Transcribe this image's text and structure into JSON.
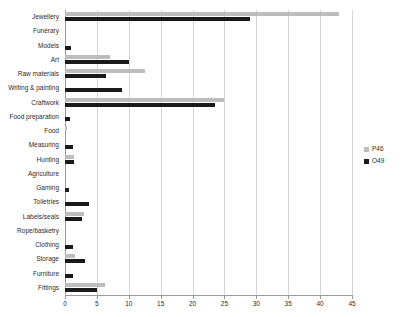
{
  "chart_data": {
    "type": "bar",
    "orientation": "horizontal",
    "title": "",
    "xlabel": "",
    "ylabel": "",
    "xlim": [
      0,
      45
    ],
    "xticks": [
      0,
      5,
      10,
      15,
      20,
      25,
      30,
      35,
      40,
      45
    ],
    "grid": true,
    "legend_position": "right",
    "categories": [
      "Jewellery",
      "Funerary",
      "Models",
      "Art",
      "Raw materials",
      "Writing & painting",
      "Craftwork",
      "Food preparation",
      "Food",
      "Measuring",
      "Hunting",
      "Agriculture",
      "Gaming",
      "Toiletries",
      "Labels/seals",
      "Rope/basketry",
      "Clothing",
      "Storage",
      "Furniture",
      "Fittings"
    ],
    "series": [
      {
        "name": "P46",
        "color": "#bdbdbd",
        "values": [
          43.0,
          0,
          0,
          7.0,
          12.5,
          0,
          25.0,
          0,
          0.3,
          0,
          1.4,
          0,
          0,
          0,
          3.0,
          0,
          0,
          1.5,
          0,
          6.2
        ]
      },
      {
        "name": "O49",
        "color": "#1a1a1a",
        "values": [
          29.0,
          0,
          1.0,
          10.0,
          6.5,
          9.0,
          23.5,
          0.8,
          0,
          1.3,
          1.4,
          0,
          0.6,
          3.7,
          2.7,
          0,
          1.3,
          3.2,
          1.2,
          5.0
        ]
      }
    ]
  },
  "legend": {
    "items": [
      {
        "label": "P46",
        "color": "#bdbdbd"
      },
      {
        "label": "O49",
        "color": "#1a1a1a"
      }
    ]
  }
}
